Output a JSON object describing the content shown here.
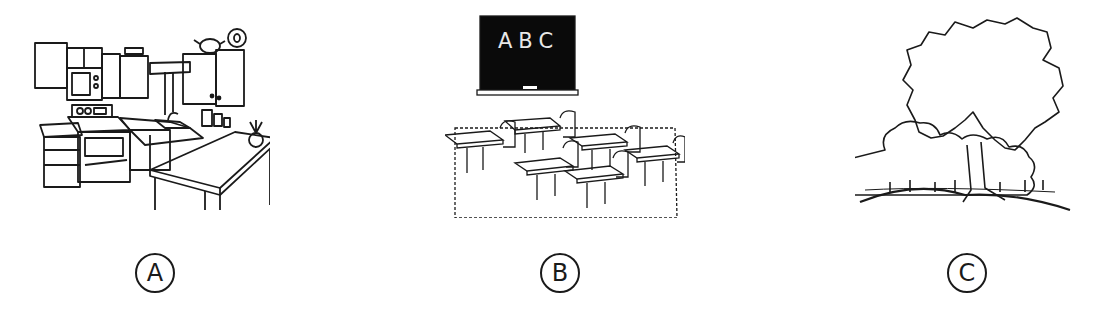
{
  "options": [
    {
      "label": "A",
      "scene": "kitchen"
    },
    {
      "label": "B",
      "scene": "classroom",
      "chalkboard_text": "ABC"
    },
    {
      "label": "C",
      "scene": "trees"
    }
  ],
  "colors": {
    "line": "#1a1a1a",
    "background": "#ffffff",
    "chalkboard": "#0a0a0a"
  }
}
